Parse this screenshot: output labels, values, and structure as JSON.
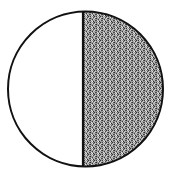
{
  "diagram": {
    "type": "half-shaded-circle",
    "circle": {
      "cx": 85.5,
      "cy": 89,
      "r": 77.5,
      "stroke": "#111111",
      "stroke_width": 2
    },
    "divider": {
      "orientation": "vertical",
      "x": 83
    },
    "regions": [
      {
        "name": "left-half",
        "fill": "#ffffff",
        "pattern": "none"
      },
      {
        "name": "right-half",
        "fill": "#8a8a8a",
        "pattern": "stipple"
      }
    ],
    "colors": {
      "stroke": "#111111",
      "stipple_dark": "#3a3a3a",
      "stipple_light": "#d0d0d0",
      "background": "#ffffff"
    }
  }
}
